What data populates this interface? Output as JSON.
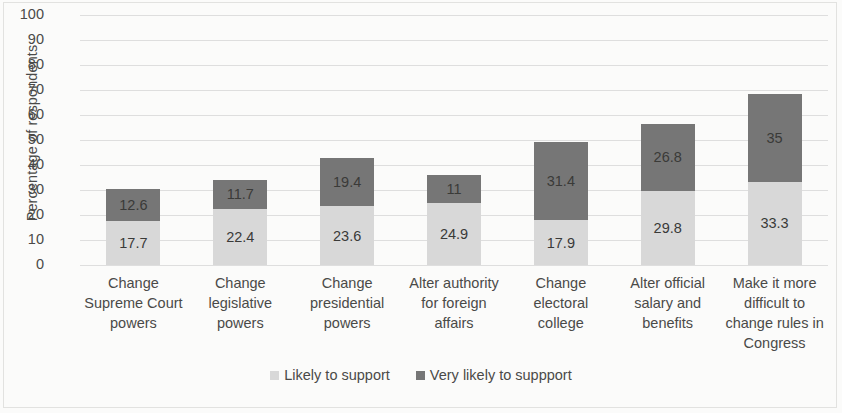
{
  "chart_data": {
    "type": "bar",
    "subtype": "stacked-bar",
    "title": "",
    "xlabel": "",
    "ylabel": "Percentage of respondents",
    "ylim": [
      0,
      100
    ],
    "y_ticks": [
      100,
      90,
      80,
      70,
      60,
      50,
      40,
      30,
      20,
      10,
      0
    ],
    "grid": true,
    "legend_position": "bottom",
    "categories": [
      "Change Supreme Court powers",
      "Change legislative powers",
      "Change presidential powers",
      "Alter authority for foreign affairs",
      "Change electoral college",
      "Alter official salary and benefits",
      "Make it more difficult to change rules in Congress"
    ],
    "category_lines": [
      [
        "Change",
        "Supreme Court",
        "powers"
      ],
      [
        "Change",
        "legislative",
        "powers"
      ],
      [
        "Change",
        "presidential",
        "powers"
      ],
      [
        "Alter authority",
        "for foreign",
        "affairs"
      ],
      [
        "Change",
        "electoral",
        "college"
      ],
      [
        "Alter official",
        "salary and",
        "benefits"
      ],
      [
        "Make it more",
        "difficult to",
        "change rules in",
        "Congress"
      ]
    ],
    "series": [
      {
        "name": "Likely to support",
        "color": "#d8d8d8",
        "values": [
          17.7,
          22.4,
          23.6,
          24.9,
          17.9,
          29.8,
          33.3
        ],
        "labels": [
          "17.7",
          "22.4",
          "23.6",
          "24.9",
          "17.9",
          "29.8",
          "33.3"
        ]
      },
      {
        "name": "Very likely to suppport",
        "color": "#767676",
        "values": [
          12.6,
          11.7,
          19.4,
          11,
          31.4,
          26.8,
          35
        ],
        "labels": [
          "12.6",
          "11.7",
          "19.4",
          "11",
          "31.4",
          "26.8",
          "35"
        ]
      }
    ],
    "totals": [
      30.3,
      34.1,
      43.0,
      35.9,
      49.3,
      56.6,
      68.3
    ]
  },
  "legend": {
    "items": [
      {
        "label": "Likely to support",
        "color": "#d8d8d8"
      },
      {
        "label": "Very likely to suppport",
        "color": "#767676"
      }
    ]
  }
}
